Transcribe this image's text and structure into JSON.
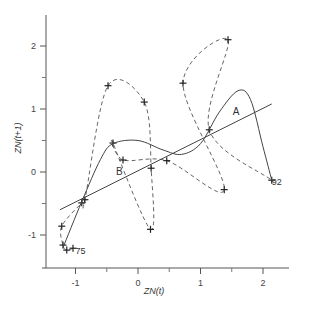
{
  "chart_data": {
    "type": "scatter",
    "title": "",
    "xlabel": "ZN(t)",
    "ylabel": "ZN(t+1)",
    "xlim": [
      -1.5,
      2.4
    ],
    "ylim": [
      -1.5,
      2.5
    ],
    "xticks": [
      -1,
      0,
      1,
      2
    ],
    "xtick_labels": [
      "-1",
      "0",
      "1",
      "2"
    ],
    "xminor": [
      -0.5,
      0.5,
      1.5
    ],
    "yticks": [
      -1,
      0,
      1,
      2
    ],
    "ytick_labels": [
      "-1",
      "0",
      "1",
      "2"
    ],
    "yminor": [
      -0.5,
      0.5,
      1.5
    ],
    "grid": false,
    "series": [
      {
        "name": "observed trajectory",
        "style": "dashed",
        "marker": "+",
        "points": [
          {
            "x": -1.04,
            "y": -1.21
          },
          {
            "x": -1.14,
            "y": -1.24
          },
          {
            "x": -1.2,
            "y": -1.16
          },
          {
            "x": -1.22,
            "y": -0.86
          },
          {
            "x": -0.9,
            "y": -0.49
          },
          {
            "x": -0.85,
            "y": -0.44
          },
          {
            "x": -0.48,
            "y": 1.37
          },
          {
            "x": 0.1,
            "y": 1.11
          },
          {
            "x": 0.21,
            "y": 0.06
          },
          {
            "x": 0.2,
            "y": -0.91
          },
          {
            "x": -0.4,
            "y": 0.46
          },
          {
            "x": -0.24,
            "y": 0.19
          },
          {
            "x": 0.46,
            "y": 0.18
          },
          {
            "x": 1.38,
            "y": -0.28
          },
          {
            "x": 0.72,
            "y": 1.41
          },
          {
            "x": 1.44,
            "y": 2.1
          },
          {
            "x": 1.14,
            "y": 0.67
          },
          {
            "x": 2.14,
            "y": -0.13
          }
        ]
      },
      {
        "name": "fitted nonlinear curve",
        "style": "solid",
        "points": [
          {
            "x": -1.2,
            "y": -1.2
          },
          {
            "x": -0.9,
            "y": -0.47
          },
          {
            "x": -0.6,
            "y": 0.2
          },
          {
            "x": -0.4,
            "y": 0.45
          },
          {
            "x": 0.0,
            "y": 0.5
          },
          {
            "x": 0.4,
            "y": 0.35
          },
          {
            "x": 0.7,
            "y": 0.28
          },
          {
            "x": 1.0,
            "y": 0.45
          },
          {
            "x": 1.3,
            "y": 0.95
          },
          {
            "x": 1.6,
            "y": 1.29
          },
          {
            "x": 1.8,
            "y": 1.15
          },
          {
            "x": 2.0,
            "y": 0.4
          },
          {
            "x": 2.14,
            "y": -0.13
          }
        ]
      },
      {
        "name": "linear fit",
        "style": "solid",
        "points": [
          {
            "x": -1.25,
            "y": -0.6
          },
          {
            "x": 2.14,
            "y": 1.08
          }
        ]
      }
    ],
    "annotations": [
      {
        "text": "A",
        "x": 1.57,
        "y": 0.9
      },
      {
        "text": "B",
        "x": -0.3,
        "y": -0.05
      },
      {
        "text": "75",
        "x": -0.92,
        "y": -1.3
      },
      {
        "text": "92",
        "x": 2.22,
        "y": -0.21
      }
    ]
  }
}
